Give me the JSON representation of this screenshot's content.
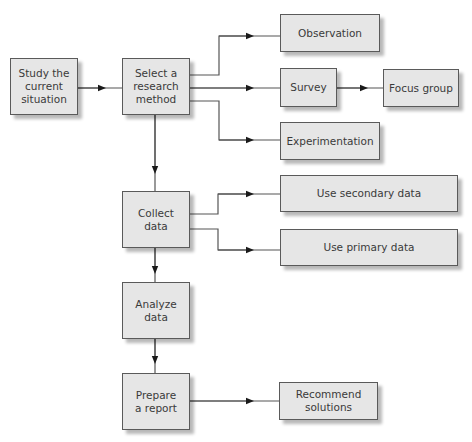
{
  "diagram": {
    "type": "flowchart",
    "colors": {
      "box_fill": "#e6e6e6",
      "box_border": "#5a5a5a",
      "text": "#3a3a3a",
      "line": "#555555",
      "background": "#ffffff"
    },
    "nodes": {
      "study": {
        "label": "Study the\ncurrent\nsituation"
      },
      "select": {
        "label": "Select a\nresearch\nmethod"
      },
      "observation": {
        "label": "Observation"
      },
      "survey": {
        "label": "Survey"
      },
      "focus_group": {
        "label": "Focus group"
      },
      "experimentation": {
        "label": "Experimentation"
      },
      "collect": {
        "label": "Collect\ndata"
      },
      "secondary": {
        "label": "Use secondary data"
      },
      "primary": {
        "label": "Use primary data"
      },
      "analyze": {
        "label": "Analyze\ndata"
      },
      "prepare": {
        "label": "Prepare\na report"
      },
      "recommend": {
        "label": "Recommend\nsolutions"
      }
    },
    "edges": [
      {
        "from": "study",
        "to": "select"
      },
      {
        "from": "select",
        "to": "observation"
      },
      {
        "from": "select",
        "to": "survey"
      },
      {
        "from": "select",
        "to": "experimentation"
      },
      {
        "from": "survey",
        "to": "focus_group"
      },
      {
        "from": "select",
        "to": "collect"
      },
      {
        "from": "collect",
        "to": "secondary"
      },
      {
        "from": "collect",
        "to": "primary"
      },
      {
        "from": "collect",
        "to": "analyze"
      },
      {
        "from": "analyze",
        "to": "prepare"
      },
      {
        "from": "prepare",
        "to": "recommend"
      }
    ]
  }
}
